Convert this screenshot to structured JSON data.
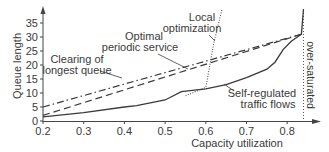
{
  "chart_data": {
    "type": "line",
    "title": "",
    "xlabel": "Capacity utilization",
    "ylabel": "Queue length",
    "xlim": [
      0.2,
      0.85
    ],
    "ylim": [
      0,
      38
    ],
    "x_ticks": [
      "0.2",
      "0.3",
      "0.4",
      "0.5",
      "0.6",
      "0.7",
      "0.8"
    ],
    "y_ticks": [
      "0",
      "5",
      "10",
      "15",
      "20",
      "25",
      "30",
      "35"
    ],
    "grid": false,
    "legend": "none (inline labels with leader lines)",
    "annotations": [
      {
        "text": "Clearing of\nlongest queue",
        "target_series": "Clearing of longest queue"
      },
      {
        "text": "Optimal\nperiodic service",
        "target_series": "Optimal periodic service"
      },
      {
        "text": "Local\noptimization",
        "target_series": "Local optimization"
      },
      {
        "text": "Self-regulated\ntraffic flows",
        "target_series": "Self-regulated traffic flows"
      },
      {
        "text": "over-saturated",
        "orientation": "vertical",
        "x": 0.84
      }
    ],
    "series": [
      {
        "name": "Clearing of longest queue",
        "style": "dash-dot",
        "x": [
          0.2,
          0.835
        ],
        "y": [
          5,
          31
        ]
      },
      {
        "name": "Optimal periodic service",
        "style": "dashed",
        "x": [
          0.2,
          0.835
        ],
        "y": [
          2,
          31
        ]
      },
      {
        "name": "Self-regulated traffic flows",
        "style": "solid",
        "x": [
          0.2,
          0.3,
          0.4,
          0.43,
          0.5,
          0.54,
          0.6,
          0.65,
          0.7,
          0.75,
          0.77,
          0.79,
          0.81,
          0.835,
          0.84
        ],
        "y": [
          1.5,
          3,
          5,
          5.5,
          7.5,
          10.5,
          11.5,
          13,
          15.5,
          18.5,
          21,
          25.5,
          28.5,
          31,
          40
        ]
      },
      {
        "name": "Local optimization",
        "style": "dotted",
        "x": [
          0.55,
          0.6,
          0.61,
          0.62,
          0.64
        ],
        "y": [
          9,
          12,
          20,
          28,
          40
        ]
      }
    ],
    "saturation_threshold_x": 0.84
  },
  "labels": {
    "ylabel": "Queue length",
    "xlabel": "Capacity utilization",
    "clearing_1": "Clearing of",
    "clearing_2": "longest queue",
    "optimal_1": "Optimal",
    "optimal_2": "periodic service",
    "local_1": "Local",
    "local_2": "optimization",
    "self_1": "Self-regulated",
    "self_2": "traffic flows",
    "oversat": "over-saturated"
  },
  "colors": {
    "line": "#3a3a3a",
    "dotted": "#555555",
    "axis": "#444444"
  }
}
